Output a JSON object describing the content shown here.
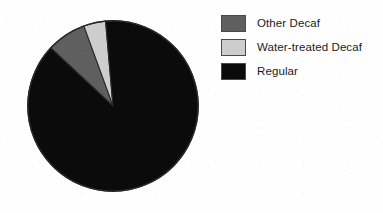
{
  "chart_data": {
    "type": "pie",
    "title": "",
    "subtitle": "",
    "xlabel": "",
    "ylabel": "",
    "grid": false,
    "legend_position": "right",
    "start_angle_deg": 0,
    "direction": "clockwise",
    "center": {
      "x": 113,
      "y": 106
    },
    "radius": 86,
    "categories": [
      "Other Decaf",
      "Water-treated Decaf",
      "Regular"
    ],
    "values": [
      7,
      5,
      88
    ],
    "unit": "percent",
    "slices": [
      {
        "label": "Other Decaf",
        "value": 7,
        "color": "#5f5f5f",
        "start_deg": 313,
        "end_deg": 340,
        "swatch_color": "#5f5f5f",
        "swatch_border": "#4a4a4a"
      },
      {
        "label": "Water-treated Decaf",
        "value": 5,
        "color": "#cdcdcd",
        "start_deg": 340,
        "end_deg": 355,
        "swatch_color": "#cdcdcd",
        "swatch_border": "#4a4a4a"
      },
      {
        "label": "Regular",
        "value": 88,
        "color": "#0b0b0b",
        "start_deg": 355,
        "end_deg": 313,
        "swatch_color": "#0b0b0b",
        "swatch_border": "#4a4a4a"
      }
    ],
    "outline_color": "#2a2a2a",
    "background": "#fefefe"
  },
  "legend": {
    "items": [
      {
        "label": "Other Decaf"
      },
      {
        "label": "Water-treated Decaf"
      },
      {
        "label": "Regular"
      }
    ]
  }
}
